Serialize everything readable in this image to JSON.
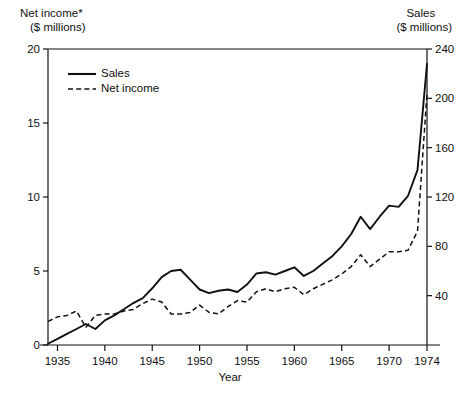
{
  "chart_data": {
    "type": "line",
    "title": "",
    "xlabel": "Year",
    "left_axis": {
      "label_line1": "Net income*",
      "label_line2": "($ millions)",
      "ticks": [
        0,
        5,
        10,
        15,
        20
      ],
      "ylim": [
        0,
        20
      ],
      "series": "Net income"
    },
    "right_axis": {
      "label_line1": "Sales",
      "label_line2": "($ millions)",
      "ticks": [
        0,
        40,
        80,
        120,
        160,
        200,
        240
      ],
      "ylim": [
        0,
        240
      ],
      "series": "Sales"
    },
    "xlim": [
      1934,
      1974
    ],
    "xticks": [
      1935,
      1940,
      1945,
      1950,
      1955,
      1960,
      1965,
      1970,
      1974
    ],
    "xtick_labels": [
      "1935",
      "1940",
      "1945",
      "1950",
      "1955",
      "1960",
      "1965",
      "1970",
      "1974"
    ],
    "grid": false,
    "legend_position": "upper-left-inside",
    "legend": [
      {
        "label": "Sales",
        "style": "solid"
      },
      {
        "label": "Net income",
        "style": "dashed"
      }
    ],
    "x": [
      1934,
      1935,
      1936,
      1937,
      1938,
      1939,
      1940,
      1941,
      1942,
      1943,
      1944,
      1945,
      1946,
      1947,
      1948,
      1949,
      1950,
      1951,
      1952,
      1953,
      1954,
      1955,
      1956,
      1957,
      1958,
      1959,
      1960,
      1961,
      1962,
      1963,
      1964,
      1965,
      1966,
      1967,
      1968,
      1969,
      1970,
      1971,
      1972,
      1973,
      1974
    ],
    "series": [
      {
        "name": "Sales",
        "axis": "right",
        "units": "$ millions",
        "values": [
          1,
          5,
          9,
          13,
          17,
          13,
          20,
          24,
          29,
          34,
          38,
          46,
          55,
          60,
          61,
          53,
          45,
          42,
          44,
          45,
          43,
          49,
          58,
          59,
          57,
          60,
          63,
          56,
          60,
          66,
          72,
          80,
          90,
          104,
          94,
          104,
          113,
          112,
          121,
          142,
          228
        ]
      },
      {
        "name": "Net income",
        "axis": "left",
        "units": "$ millions",
        "values": [
          1.6,
          1.9,
          2.0,
          2.3,
          1.2,
          2.0,
          2.1,
          2.1,
          2.3,
          2.4,
          2.8,
          3.1,
          2.9,
          2.1,
          2.1,
          2.2,
          2.7,
          2.2,
          2.1,
          2.6,
          3.0,
          2.9,
          3.6,
          3.8,
          3.6,
          3.8,
          3.9,
          3.4,
          3.8,
          4.1,
          4.4,
          4.8,
          5.3,
          6.1,
          5.3,
          5.8,
          6.3,
          6.3,
          6.4,
          7.7,
          17.0
        ]
      }
    ]
  }
}
